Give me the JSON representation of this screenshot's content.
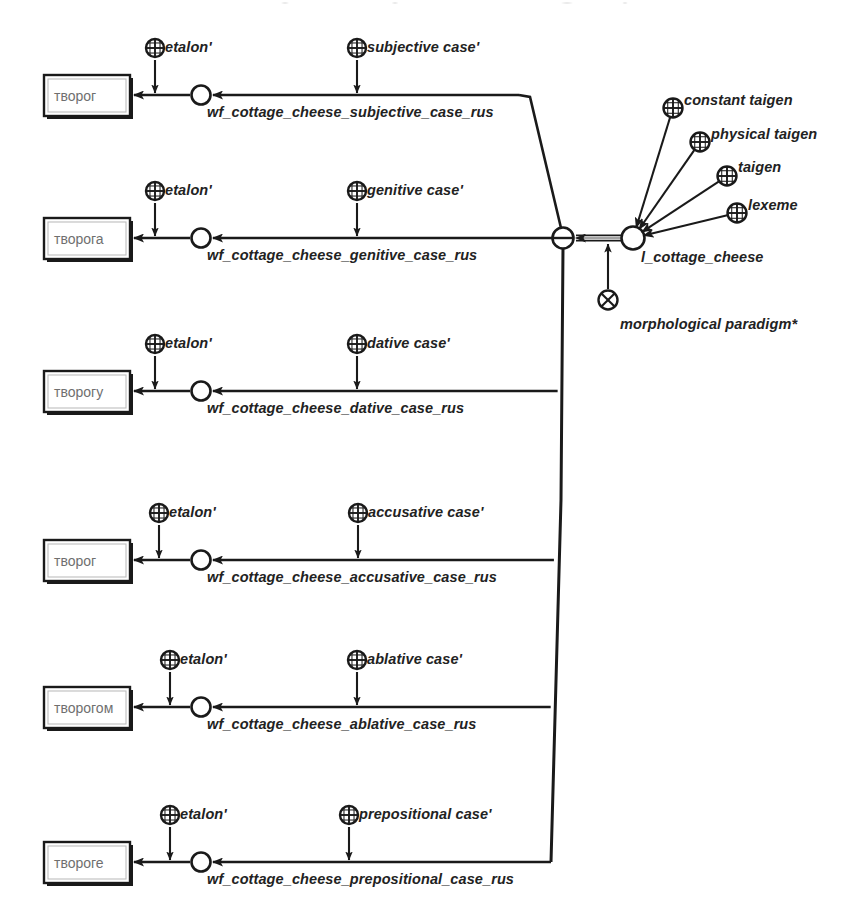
{
  "diagram": {
    "kind": "conceptual-graph",
    "title_visible": false,
    "colors": {
      "ink": "#1a1a1a",
      "box_text": "#6f6f6f",
      "label_text": "#222222",
      "background": "#ffffff"
    },
    "central_node": {
      "id": "l_cottage_cheese",
      "label": "l_cottage_cheese",
      "symbol": "circle-node",
      "x": 633,
      "y": 238
    },
    "paradigm_hub": {
      "id": "paradigm-hub",
      "symbol": "circle-minus-node",
      "x": 563,
      "y": 238
    },
    "attributes": [
      {
        "label": "constant taigen",
        "symbol": "circle-plus-grid",
        "x": 673,
        "y": 108,
        "text_x": 684,
        "text_y": 93
      },
      {
        "label": "physical taigen",
        "symbol": "circle-plus-grid",
        "x": 700,
        "y": 142,
        "text_x": 711,
        "text_y": 127
      },
      {
        "label": "taigen",
        "symbol": "circle-plus-grid",
        "x": 727,
        "y": 176,
        "text_x": 738,
        "text_y": 160
      },
      {
        "label": "lexeme",
        "symbol": "circle-plus-grid",
        "x": 737,
        "y": 213,
        "text_x": 748,
        "text_y": 198
      }
    ],
    "paradigm_marker": {
      "label": "morphological paradigm*",
      "symbol": "circle-times-node",
      "x": 608,
      "y": 300,
      "text_x": 620,
      "text_y": 317
    },
    "rows": [
      {
        "id": "subjective",
        "wordform": "творог",
        "wf_label": "wf_cottage_cheese_subjective_case_rus",
        "case_label": "subjective case'",
        "etalon_label": "etalon'",
        "line_y": 95,
        "box": {
          "x": 44,
          "y": 75,
          "w": 86,
          "h": 41
        },
        "wf_node_x": 201,
        "etalon_x": 155,
        "etalon_y": 48,
        "case_x": 357,
        "case_y": 48,
        "wf_text_x": 207,
        "wf_text_y": 105
      },
      {
        "id": "genitive",
        "wordform": "творога",
        "wf_label": "wf_cottage_cheese_genitive_case_rus",
        "case_label": "genitive case'",
        "etalon_label": "etalon'",
        "line_y": 238,
        "box": {
          "x": 44,
          "y": 218,
          "w": 86,
          "h": 41
        },
        "wf_node_x": 201,
        "etalon_x": 155,
        "etalon_y": 191,
        "case_x": 357,
        "case_y": 191,
        "wf_text_x": 207,
        "wf_text_y": 248
      },
      {
        "id": "dative",
        "wordform": "творогу",
        "wf_label": "wf_cottage_cheese_dative_case_rus",
        "case_label": "dative case'",
        "etalon_label": "etalon'",
        "line_y": 391,
        "box": {
          "x": 44,
          "y": 371,
          "w": 86,
          "h": 41
        },
        "wf_node_x": 201,
        "etalon_x": 155,
        "etalon_y": 344,
        "case_x": 357,
        "case_y": 344,
        "wf_text_x": 207,
        "wf_text_y": 401
      },
      {
        "id": "accusative",
        "wordform": "творог",
        "wf_label": "wf_cottage_cheese_accusative_case_rus",
        "case_label": "accusative case'",
        "etalon_label": "etalon'",
        "line_y": 560,
        "box": {
          "x": 44,
          "y": 540,
          "w": 86,
          "h": 41
        },
        "wf_node_x": 201,
        "etalon_x": 159,
        "etalon_y": 513,
        "case_x": 358,
        "case_y": 513,
        "wf_text_x": 207,
        "wf_text_y": 570
      },
      {
        "id": "ablative",
        "wordform": "творогом",
        "wf_label": "wf_cottage_cheese_ablative_case_rus",
        "case_label": "ablative case'",
        "etalon_label": "etalon'",
        "line_y": 707,
        "box": {
          "x": 44,
          "y": 687,
          "w": 86,
          "h": 41
        },
        "wf_node_x": 201,
        "etalon_x": 170,
        "etalon_y": 660,
        "case_x": 357,
        "case_y": 660,
        "wf_text_x": 207,
        "wf_text_y": 717
      },
      {
        "id": "prepositional",
        "wordform": "твороге",
        "wf_label": "wf_cottage_cheese_prepositional_case_rus",
        "case_label": "prepositional case'",
        "etalon_label": "etalon'",
        "line_y": 862,
        "box": {
          "x": 44,
          "y": 842,
          "w": 86,
          "h": 41
        },
        "wf_node_x": 201,
        "etalon_x": 170,
        "etalon_y": 815,
        "case_x": 349,
        "case_y": 815,
        "wf_text_x": 207,
        "wf_text_y": 872
      }
    ]
  }
}
